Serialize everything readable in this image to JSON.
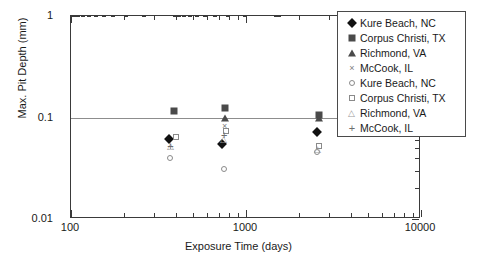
{
  "chart_data": {
    "type": "scatter",
    "title": "",
    "xlabel": "Exposure Time (days)",
    "ylabel": "Max. Pit Depth (mm)",
    "xscale": "log",
    "yscale": "log",
    "xlim": [
      100,
      10000
    ],
    "ylim": [
      0.01,
      1
    ],
    "xticks": [
      100,
      1000,
      10000
    ],
    "xtick_labels": [
      "100",
      "1000",
      "10000"
    ],
    "yticks": [
      0.01,
      0.1,
      1
    ],
    "ytick_labels": [
      "0.01",
      "0.1",
      "1"
    ],
    "grid": "horizontal-major-only",
    "legend_position": "top-right",
    "series": [
      {
        "name": "Kure Beach, NC",
        "marker": "filled-diamond",
        "color": "#111111",
        "points": [
          {
            "x": 365,
            "y": 0.062
          },
          {
            "x": 730,
            "y": 0.055
          },
          {
            "x": 2555,
            "y": 0.072
          }
        ]
      },
      {
        "name": "Corpus Christi, TX",
        "marker": "filled-square",
        "color": "#4a4a4a",
        "points": [
          {
            "x": 390,
            "y": 0.115
          },
          {
            "x": 760,
            "y": 0.125
          },
          {
            "x": 2600,
            "y": 0.105
          }
        ]
      },
      {
        "name": "Richmond, VA",
        "marker": "filled-triangle",
        "color": "#4a4a4a",
        "points": [
          {
            "x": 760,
            "y": 0.098
          },
          {
            "x": 2600,
            "y": 0.1
          }
        ]
      },
      {
        "name": "McCook, IL",
        "marker": "cross",
        "color": "#7d7d7d",
        "points": [
          {
            "x": 755,
            "y": 0.082
          }
        ]
      },
      {
        "name": "Kure Beach, NC",
        "marker": "open-circle",
        "color": "#8a8a8a",
        "points": [
          {
            "x": 370,
            "y": 0.04
          },
          {
            "x": 745,
            "y": 0.031
          },
          {
            "x": 2545,
            "y": 0.046
          }
        ]
      },
      {
        "name": "Corpus Christi, TX",
        "marker": "open-square",
        "color": "#8a8a8a",
        "points": [
          {
            "x": 400,
            "y": 0.064
          },
          {
            "x": 770,
            "y": 0.074
          },
          {
            "x": 2620,
            "y": 0.052
          }
        ]
      },
      {
        "name": "Richmond, VA",
        "marker": "open-triangle",
        "color": "#9a9a9a",
        "points": [
          {
            "x": 372,
            "y": 0.052
          },
          {
            "x": 752,
            "y": 0.062
          },
          {
            "x": 2570,
            "y": 0.049
          }
        ]
      },
      {
        "name": "McCook, IL",
        "marker": "plus",
        "color": "#6d6d6d",
        "points": [
          {
            "x": 370,
            "y": 0.052
          },
          {
            "x": 750,
            "y": 0.068
          }
        ]
      }
    ]
  },
  "axes": {
    "y_title": "Max. Pit Depth (mm)",
    "x_title": "Exposure Time (days)",
    "y_tick_labels": [
      "1",
      "0.1",
      "0.01"
    ],
    "x_tick_labels": [
      "100",
      "1000",
      "10000"
    ]
  },
  "legend": {
    "items": [
      {
        "label": "Kure Beach, NC",
        "marker": "filled-diamond"
      },
      {
        "label": "Corpus Christi, TX",
        "marker": "filled-square"
      },
      {
        "label": "Richmond, VA",
        "marker": "filled-triangle"
      },
      {
        "label": "McCook, IL",
        "marker": "cross"
      },
      {
        "label": "Kure Beach, NC",
        "marker": "open-circle"
      },
      {
        "label": "Corpus Christi, TX",
        "marker": "open-square"
      },
      {
        "label": "Richmond, VA",
        "marker": "open-triangle"
      },
      {
        "label": "McCook, IL",
        "marker": "plus"
      }
    ]
  }
}
